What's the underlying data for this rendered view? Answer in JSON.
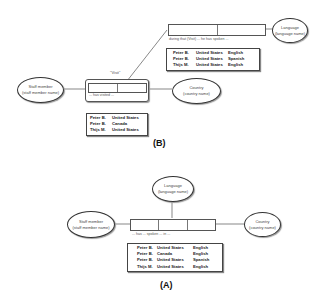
{
  "figure_b": {
    "label": "(B)",
    "entities": {
      "staff": {
        "title": "Staff member",
        "subtitle": "(staff member name)"
      },
      "country": {
        "title": "Country",
        "subtitle": "(country name)"
      },
      "language": {
        "title": "Language",
        "subtitle": "(language name)"
      }
    },
    "objectified_label": "\"Visit\"",
    "inner_fact_caption": "... has visited ...",
    "outer_fact_caption": "during that (Visit) ... he has spoken ...",
    "inner_table": [
      [
        "Peter B.",
        "United States"
      ],
      [
        "Peter B.",
        "Canada"
      ],
      [
        "Thijs M.",
        "United States"
      ]
    ],
    "outer_table": [
      [
        "Peter B.",
        "United States",
        "English"
      ],
      [
        "Peter B.",
        "United States",
        "Spanish"
      ],
      [
        "Thijs M.",
        "United States",
        "English"
      ]
    ]
  },
  "figure_a": {
    "label": "(A)",
    "entities": {
      "staff": {
        "title": "Staff member",
        "subtitle": "(staff member name)"
      },
      "country": {
        "title": "Country",
        "subtitle": "(country name)"
      },
      "language": {
        "title": "Language",
        "subtitle": "(language name)"
      }
    },
    "fact_caption": "... has ... spoken ... in ...",
    "table": [
      [
        "Peter B.",
        "United States",
        "English"
      ],
      [
        "Peter B.",
        "Canada",
        "English"
      ],
      [
        "Peter B.",
        "United States",
        "Spanish"
      ],
      [
        "Thijs M.",
        "United States",
        "English"
      ]
    ]
  }
}
